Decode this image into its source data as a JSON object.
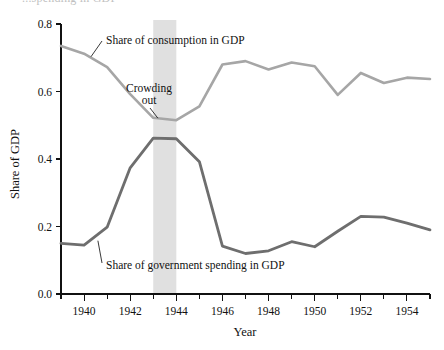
{
  "figure": {
    "cut_off_header_text": "...spending in GDP",
    "background_color": "#ffffff"
  },
  "chart_data": {
    "type": "line",
    "title": "",
    "xlabel": "Year",
    "ylabel": "Share of GDP",
    "xlim": [
      1939,
      1955
    ],
    "ylim": [
      0.0,
      0.8
    ],
    "grid": false,
    "legend_position": "inline-annotations",
    "x": [
      1939,
      1940,
      1941,
      1942,
      1943,
      1944,
      1945,
      1946,
      1947,
      1948,
      1949,
      1950,
      1951,
      1952,
      1953,
      1954,
      1955
    ],
    "series": [
      {
        "name": "Share of consumption in GDP",
        "color": "#a6a6a6",
        "values": [
          0.735,
          0.712,
          0.672,
          0.592,
          0.522,
          0.515,
          0.556,
          0.68,
          0.69,
          0.665,
          0.686,
          0.675,
          0.59,
          0.655,
          0.625,
          0.641,
          0.637
        ]
      },
      {
        "name": "Share of government spending in GDP",
        "color": "#6e6e6e",
        "values": [
          0.15,
          0.145,
          0.198,
          0.374,
          0.462,
          0.46,
          0.392,
          0.142,
          0.12,
          0.128,
          0.155,
          0.14,
          0.186,
          0.23,
          0.228,
          0.21,
          0.19
        ]
      }
    ],
    "x_tick_labels": [
      "1940",
      "1942",
      "1944",
      "1946",
      "1948",
      "1950",
      "1952",
      "1954"
    ],
    "x_tick_values": [
      1940,
      1942,
      1944,
      1946,
      1948,
      1950,
      1952,
      1954
    ],
    "x_minor_tick_values": [
      1939,
      1941,
      1943,
      1945,
      1947,
      1949,
      1951,
      1953,
      1955
    ],
    "y_tick_labels": [
      "0.0",
      "0.2",
      "0.4",
      "0.6",
      "0.8"
    ],
    "y_tick_values": [
      0.0,
      0.2,
      0.4,
      0.6,
      0.8
    ],
    "annotations": [
      {
        "name": "consumption-label",
        "text": "Share of consumption in GDP",
        "x": 1939.0,
        "y": 0.735
      },
      {
        "name": "crowding-out-label",
        "text_line1": "Crowding",
        "text_line2": "out",
        "x": 1943.2,
        "y": 0.515
      },
      {
        "name": "government-spending-label",
        "text": "Share of government spending in GDP",
        "x": 1940.4,
        "y": 0.15
      }
    ],
    "shaded_band": {
      "name": "crowding-out-band",
      "x_start": 1943,
      "x_end": 1944,
      "color": "#e0e0e0"
    }
  }
}
